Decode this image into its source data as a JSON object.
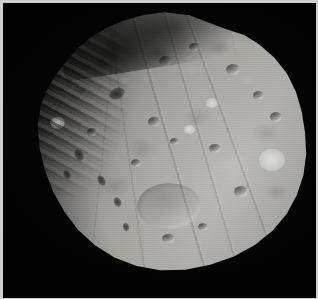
{
  "image": {
    "subject": "Phobos",
    "description": "Grayscale spacecraft image of the irregular, heavily cratered Martian moon Phobos against black space",
    "orientation": "landscape",
    "width_px": 318,
    "height_px": 299,
    "color_mode": "grayscale",
    "background_color": "#000000",
    "frame_border_color": "#cfcfcf",
    "body_highlight_color": "#b6b5b0",
    "body_midtone_color": "#8f8e89",
    "body_shadow_color": "#2a2927",
    "illumination": "lit from lower right, terminator along upper-left limb"
  },
  "features": [
    {
      "name": "bright-limb-crater",
      "x_pct": 12.5,
      "y_pct": 43,
      "size_px": 14,
      "tone": "bright"
    },
    {
      "name": "right-limb-crater",
      "x_pct": 88,
      "y_pct": 58,
      "size_px": 26,
      "tone": "bright"
    },
    {
      "name": "central-basin",
      "x_pct": 52,
      "y_pct": 76,
      "size_px": 62,
      "tone": "subtle"
    },
    {
      "name": "elongated-dark-crater",
      "x_pct": 33,
      "y_pct": 33,
      "size_px": 15,
      "tone": "dark"
    },
    {
      "name": "terminator-ridge-band",
      "x_pct": 14,
      "y_pct": 30,
      "size_px": 0,
      "tone": "shadow"
    },
    {
      "name": "groove-set",
      "x_pct": 62,
      "y_pct": 55,
      "size_px": 0,
      "tone": "linear-striations"
    }
  ],
  "caption": {
    "title": "Phobos",
    "alt_text": "Phobos, the larger moon of Mars, shown as a cratered irregular body on a black background"
  }
}
